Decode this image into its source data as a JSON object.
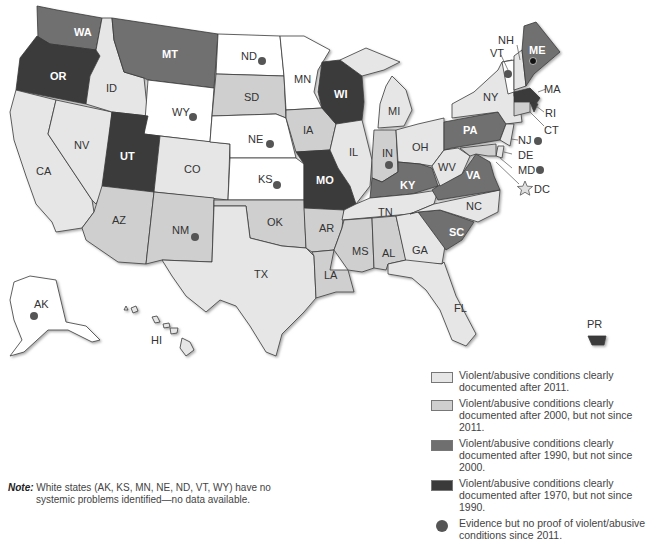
{
  "colors": {
    "white": "#ffffff",
    "after_2011": "#e6e6e6",
    "after_2000": "#cfcfcf",
    "after_1990": "#6f6f6f",
    "after_1970": "#3a3a3a",
    "dot": "#555555",
    "outline": "#3a3a3a"
  },
  "states": {
    "WA": "WA",
    "OR": "OR",
    "CA": "CA",
    "NV": "NV",
    "ID": "ID",
    "MT": "MT",
    "WY": "WY",
    "UT": "UT",
    "CO": "CO",
    "AZ": "AZ",
    "NM": "NM",
    "ND": "ND",
    "SD": "SD",
    "NE": "NE",
    "KS": "KS",
    "OK": "OK",
    "TX": "TX",
    "MN": "MN",
    "IA": "IA",
    "MO": "MO",
    "AR": "AR",
    "LA": "LA",
    "WI": "WI",
    "IL": "IL",
    "MI": "MI",
    "IN": "IN",
    "OH": "OH",
    "KY": "KY",
    "TN": "TN",
    "MS": "MS",
    "AL": "AL",
    "GA": "GA",
    "FL": "FL",
    "SC": "SC",
    "NC": "NC",
    "VA": "VA",
    "WV": "WV",
    "PA": "PA",
    "NY": "NY",
    "VT": "VT",
    "NH": "NH",
    "ME": "ME",
    "MA": "MA",
    "RI": "RI",
    "CT": "CT",
    "NJ": "NJ",
    "DE": "DE",
    "MD": "MD",
    "DC": "DC",
    "AK": "AK",
    "HI": "HI",
    "PR": "PR"
  },
  "categories": {
    "white": [
      "AK",
      "KS",
      "MN",
      "NE",
      "ND",
      "VT",
      "WY"
    ],
    "after_2011": [
      "CA",
      "NV",
      "ID",
      "CO",
      "TX",
      "IA",
      "IL",
      "MI",
      "OH",
      "WV",
      "TN",
      "AL",
      "GA",
      "FL",
      "NY",
      "NH",
      "NJ",
      "DE",
      "HI"
    ],
    "after_2000": [
      "AZ",
      "NM",
      "SD",
      "OK",
      "AR",
      "LA",
      "MS",
      "IN",
      "NC",
      "CT",
      "MD"
    ],
    "after_1990": [
      "WA",
      "MT",
      "PA",
      "KY",
      "VA",
      "SC",
      "ME"
    ],
    "after_1970": [
      "OR",
      "UT",
      "WI",
      "MO",
      "MA",
      "RI",
      "PR"
    ],
    "evidence_dot": [
      "ND",
      "WY",
      "NE",
      "KS",
      "NM",
      "IN",
      "VT",
      "ME",
      "NJ",
      "MD",
      "AK"
    ],
    "star": [
      "DC"
    ]
  },
  "legend": [
    {
      "key": "after_2011",
      "text": "Violent/abusive conditions clearly documented after 2011."
    },
    {
      "key": "after_2000",
      "text": "Violent/abusive conditions clearly documented after 2000, but not since 2011."
    },
    {
      "key": "after_1990",
      "text": "Violent/abusive conditions clearly documented after 1990, but not since 2000."
    },
    {
      "key": "after_1970",
      "text": "Violent/abusive conditions clearly documented after 1970, but not since 1990."
    },
    {
      "key": "dot",
      "text": "Evidence but no proof of violent/abusive conditions since 2011."
    }
  ],
  "note": {
    "head": "Note:",
    "line1": " White states (AK, KS, MN, NE, ND, VT, WY) have no",
    "line2": "systemic problems identified—no data available."
  }
}
